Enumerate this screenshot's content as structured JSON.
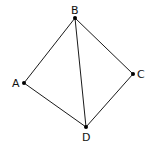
{
  "diagram": {
    "type": "graph",
    "vertices": [
      {
        "id": "A",
        "label": "A",
        "x": 24,
        "y": 83,
        "label_x": 12,
        "label_y": 87
      },
      {
        "id": "B",
        "label": "B",
        "x": 75,
        "y": 18,
        "label_x": 71,
        "label_y": 14
      },
      {
        "id": "C",
        "label": "C",
        "x": 133,
        "y": 74,
        "label_x": 137,
        "label_y": 78
      },
      {
        "id": "D",
        "label": "D",
        "x": 86,
        "y": 127,
        "label_x": 82,
        "label_y": 141
      }
    ],
    "edges": [
      {
        "from": "A",
        "to": "B"
      },
      {
        "from": "B",
        "to": "C"
      },
      {
        "from": "C",
        "to": "D"
      },
      {
        "from": "D",
        "to": "A"
      },
      {
        "from": "B",
        "to": "D"
      }
    ],
    "colors": {
      "line": "#1a1a1a",
      "vertex": "#000000",
      "background": "#ffffff"
    }
  }
}
